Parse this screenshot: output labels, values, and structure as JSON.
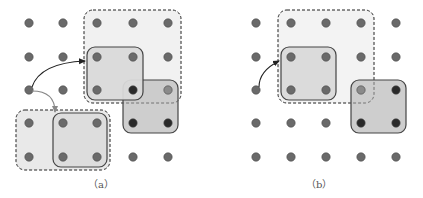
{
  "panels": [
    {
      "id": "a",
      "caption": "（a）",
      "grid": {
        "cols": 5,
        "rows": 5
      },
      "dashed_regions": [
        {
          "name": "dashed-window-top",
          "cells": [
            2,
            0,
            4,
            2
          ],
          "fill": "#f1f1f1"
        },
        {
          "name": "dashed-window-bottom",
          "cells": [
            0,
            3,
            2,
            4
          ],
          "fill": "#e9e9e9"
        }
      ],
      "solid_regions": [
        {
          "name": "shaded-block-dark",
          "cells": [
            3,
            2,
            4,
            3
          ],
          "fill": "#c6c6c6",
          "opacity": 0.85
        },
        {
          "name": "kernel-block-top",
          "cells": [
            2,
            1,
            3,
            2
          ],
          "fill": "#d9d9d9",
          "opacity": 0.95
        },
        {
          "name": "kernel-block-bottom",
          "cells": [
            1,
            3,
            2,
            4
          ],
          "fill": "#dcdcdc",
          "opacity": 0.9
        }
      ],
      "dark_dots": [
        [
          3,
          2
        ],
        [
          3,
          3
        ],
        [
          4,
          3
        ]
      ],
      "muted_dots": [
        [
          4,
          2
        ]
      ],
      "arrows": [
        {
          "name": "offset-arrow-black",
          "from": [
            0,
            2
          ],
          "to": [
            2,
            1
          ],
          "color": "#222222"
        },
        {
          "name": "offset-arrow-gray",
          "from": [
            0,
            2
          ],
          "to": [
            1,
            3
          ],
          "color": "#888888"
        }
      ]
    },
    {
      "id": "b",
      "caption": "（b）",
      "grid": {
        "cols": 5,
        "rows": 5
      },
      "dashed_regions": [
        {
          "name": "dashed-window",
          "cells": [
            1,
            0,
            3,
            2
          ],
          "fill": "#f3f3f3"
        }
      ],
      "solid_regions": [
        {
          "name": "kernel-block",
          "cells": [
            1,
            1,
            2,
            2
          ],
          "fill": "#d9d9d9",
          "opacity": 0.95
        },
        {
          "name": "shaded-block-dark",
          "cells": [
            3,
            2,
            4,
            3
          ],
          "fill": "#c6c6c6",
          "opacity": 0.85
        }
      ],
      "dark_dots": [
        [
          4,
          2
        ],
        [
          3,
          3
        ],
        [
          4,
          3
        ]
      ],
      "muted_dots": [
        [
          3,
          2
        ]
      ],
      "arrows": [
        {
          "name": "offset-arrow-black",
          "from": [
            0,
            2
          ],
          "to": [
            1,
            1
          ],
          "color": "#222222"
        }
      ]
    }
  ],
  "colors": {
    "dot": "#6a6a6a",
    "dot_stroke": "#4a4a4a",
    "dot_dark": "#2a2a2a",
    "dot_muted": "#8a8a8a",
    "solid_stroke": "#444444",
    "dashed_stroke": "#555555"
  }
}
